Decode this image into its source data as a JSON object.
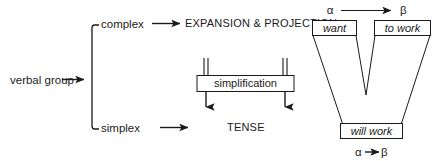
{
  "diagram": {
    "root": {
      "label": "verbal group"
    },
    "branches": [
      {
        "key": "complex",
        "label": "complex",
        "result": "EXPANSION & PROJECTION"
      },
      {
        "key": "simplex",
        "label": "simplex",
        "result": "TENSE"
      }
    ],
    "process_box": {
      "label": "simplification"
    },
    "example": {
      "top_notation": {
        "alpha": "α",
        "beta": "β"
      },
      "bottom_notation": {
        "alpha": "α",
        "beta": "β"
      },
      "boxes": [
        {
          "key": "alpha-top",
          "text": "want"
        },
        {
          "key": "beta-top",
          "text": "to work"
        },
        {
          "key": "result",
          "text": "will work"
        }
      ]
    }
  },
  "colors": {
    "ink": "#1a1a1a",
    "paper": "#ffffff"
  }
}
